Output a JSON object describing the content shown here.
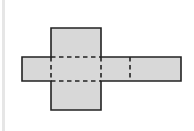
{
  "diagram": {
    "type": "net-of-rectangular-prism",
    "fill_color": "#d8d8d8",
    "stroke_color": "#222222",
    "left_bar_color": "#e6e6e6",
    "faces": [
      {
        "name": "top-face",
        "x": 51,
        "y": 28,
        "w": 50,
        "h": 29
      },
      {
        "name": "left-face",
        "x": 22,
        "y": 57,
        "w": 29,
        "h": 24
      },
      {
        "name": "front-face",
        "x": 51,
        "y": 57,
        "w": 50,
        "h": 24
      },
      {
        "name": "right-face",
        "x": 101,
        "y": 57,
        "w": 29,
        "h": 24
      },
      {
        "name": "back-face",
        "x": 130,
        "y": 57,
        "w": 51,
        "h": 24
      },
      {
        "name": "bottom-face",
        "x": 51,
        "y": 81,
        "w": 50,
        "h": 29
      }
    ],
    "fold_lines": [
      {
        "name": "fold-top",
        "x1": 51,
        "y1": 57,
        "x2": 101,
        "y2": 57
      },
      {
        "name": "fold-bottom",
        "x1": 51,
        "y1": 81,
        "x2": 101,
        "y2": 81
      },
      {
        "name": "fold-left",
        "x1": 51,
        "y1": 57,
        "x2": 51,
        "y2": 81
      },
      {
        "name": "fold-right",
        "x1": 101,
        "y1": 57,
        "x2": 101,
        "y2": 81
      },
      {
        "name": "fold-back",
        "x1": 130,
        "y1": 57,
        "x2": 130,
        "y2": 81
      }
    ]
  }
}
